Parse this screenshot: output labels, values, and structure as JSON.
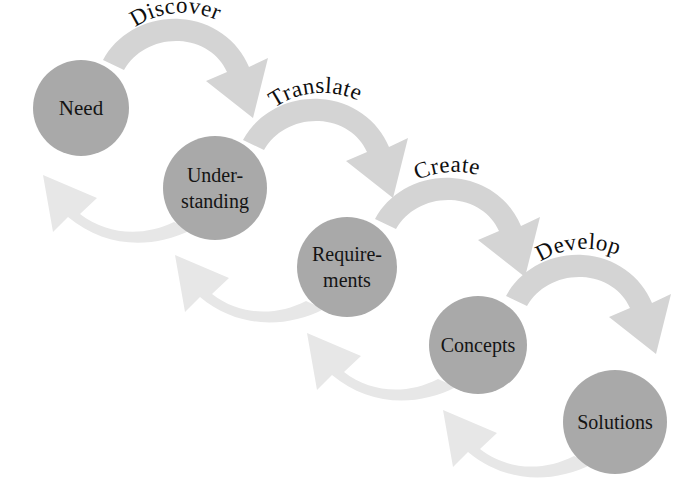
{
  "diagram": {
    "type": "cascading-cycle-diagram",
    "background_color": "#ffffff",
    "node_fill_color": "#a9a9a9",
    "node_text_color": "#141414",
    "forward_arrow_color": "#d2d2d2",
    "return_arrow_color": "#e6e6e6",
    "arrow_label_color": "#0f0f0f"
  },
  "nodes": [
    {
      "id": "need",
      "label": "Need",
      "label_line1": "Need",
      "label_line2": "",
      "cx": 81,
      "cy": 108,
      "r": 48
    },
    {
      "id": "understanding",
      "label": "Understanding",
      "label_line1": "Under-",
      "label_line2": "standing",
      "cx": 215,
      "cy": 188,
      "r": 52
    },
    {
      "id": "requirements",
      "label": "Requirements",
      "label_line1": "Require-",
      "label_line2": "ments",
      "cx": 347,
      "cy": 267,
      "r": 50
    },
    {
      "id": "concepts",
      "label": "Concepts",
      "label_line1": "Concepts",
      "label_line2": "",
      "cx": 478,
      "cy": 345,
      "r": 49
    },
    {
      "id": "solutions",
      "label": "Solutions",
      "label_line1": "Solutions",
      "label_line2": "",
      "cx": 615,
      "cy": 422,
      "r": 52
    }
  ],
  "forward_arrows": [
    {
      "id": "discover",
      "label": "Discover",
      "from": "need",
      "to": "understanding"
    },
    {
      "id": "translate",
      "label": "Translate",
      "from": "understanding",
      "to": "requirements"
    },
    {
      "id": "create",
      "label": "Create",
      "from": "requirements",
      "to": "concepts"
    },
    {
      "id": "develop",
      "label": "Develop",
      "from": "concepts",
      "to": "solutions"
    }
  ],
  "return_arrows": [
    {
      "id": "return-1",
      "label": "",
      "from": "understanding",
      "to": "need"
    },
    {
      "id": "return-2",
      "label": "",
      "from": "requirements",
      "to": "understanding"
    },
    {
      "id": "return-3",
      "label": "",
      "from": "concepts",
      "to": "requirements"
    },
    {
      "id": "return-4",
      "label": "",
      "from": "solutions",
      "to": "concepts"
    }
  ]
}
